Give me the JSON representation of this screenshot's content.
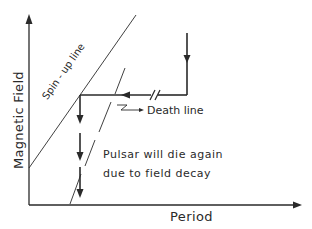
{
  "diagram": {
    "title": "",
    "axes": {
      "y_label": "Magnetic Field",
      "x_label": "Period"
    },
    "lines": {
      "spin_up_label": "Spin - up line",
      "death_line_label": "Death line"
    },
    "annotation": {
      "line1": "Pulsar will die again",
      "line2": "due to field decay"
    },
    "colors": {
      "ink": "#2a2a2a",
      "background": "#ffffff"
    }
  }
}
